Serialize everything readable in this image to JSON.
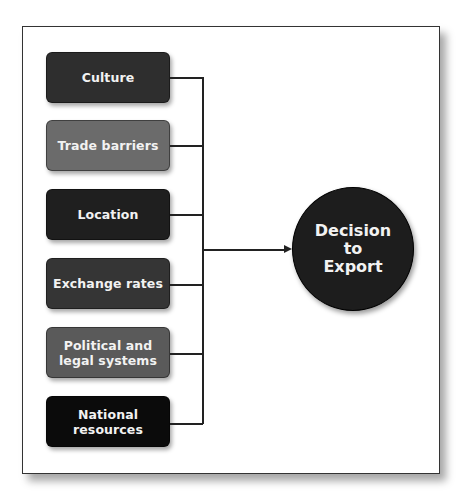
{
  "diagram": {
    "factors": [
      {
        "label": "Culture",
        "color": "#2e2e2e"
      },
      {
        "label": "Trade barriers",
        "color": "#6b6b6b"
      },
      {
        "label": "Location",
        "color": "#1f1f1f"
      },
      {
        "label": "Exchange rates",
        "color": "#353535"
      },
      {
        "label": "Political and legal systems",
        "line1": "Political and",
        "line2": "legal systems",
        "color": "#5a5a5a"
      },
      {
        "label": "National resources",
        "line1": "National",
        "line2": "resources",
        "color": "#0b0b0b"
      }
    ],
    "outcome": {
      "label": "Decision to Export",
      "line1": "Decision",
      "line2": "to",
      "line3": "Export",
      "color": "#1d1d1d"
    }
  }
}
